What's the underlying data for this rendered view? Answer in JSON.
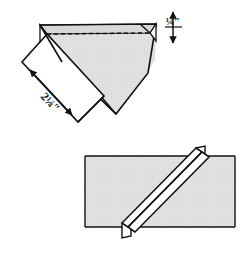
{
  "figure": {
    "type": "technical-illustration",
    "canvas": {
      "width": 249,
      "height": 258
    },
    "background_color": "#ffffff"
  },
  "colors": {
    "fabric_fill": "#e2e2e2",
    "fold_highlight_fill": "#ffffff",
    "line_color": "#111111",
    "text_color": "#101010",
    "background": "#ffffff"
  },
  "upper_figure": {
    "name": "overlapped-bias-strips",
    "description": "Two fabric strips crossed at right angles, top strip folded back, dashed stitching line across the upper edge",
    "dimensions": [
      {
        "id": "strip-width",
        "label": "2¼″",
        "value": 2.25,
        "unit": "inch",
        "orientation": "diagonal",
        "arrow_style": "double-headed",
        "position": "lower-left"
      },
      {
        "id": "seam-allowance",
        "label": "¼″",
        "value": 0.25,
        "unit": "inch",
        "orientation": "vertical",
        "arrow_style": "double-headed",
        "position": "upper-right"
      }
    ],
    "features": [
      {
        "id": "stitch-line",
        "style": "dashed",
        "label": "stitching line"
      },
      {
        "id": "notch-tip-left",
        "style": "solid",
        "label": "strip corner tip"
      },
      {
        "id": "notch-tip-right",
        "style": "solid",
        "label": "strip corner tip"
      }
    ]
  },
  "lower_figure": {
    "name": "joined-bias-strip",
    "description": "Continuous bias strip with the diagonal seam pressed open forming a raised ridge",
    "features": [
      {
        "id": "strip-band",
        "label": "bias strip band"
      },
      {
        "id": "diagonal-seam-ridge",
        "label": "diagonal seam ridge"
      },
      {
        "id": "seam-tail-top",
        "label": "seam allowance tail"
      },
      {
        "id": "seam-tail-bottom",
        "label": "seam allowance tail"
      }
    ]
  }
}
